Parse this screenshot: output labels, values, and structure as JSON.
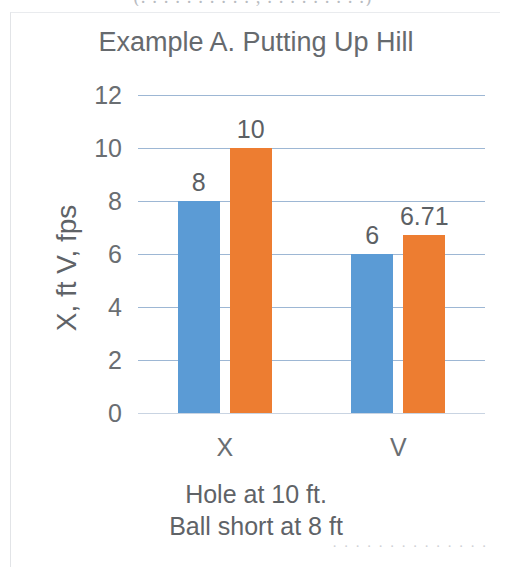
{
  "page": {
    "top_cut_text": "(. . . . . . .     . . . ,  . . . . . .     . . .)",
    "bottom_cut_text": ". . . . . .   . . . . .   . . ."
  },
  "chart_data": {
    "type": "bar",
    "title": "Example A. Putting Up Hill",
    "categories": [
      "X",
      "V"
    ],
    "series": [
      {
        "name": "X",
        "color": "#5B9BD5",
        "values": [
          8,
          6
        ],
        "labels": [
          "8",
          "6"
        ]
      },
      {
        "name": "V",
        "color": "#ED7D31",
        "values": [
          10,
          6.71
        ],
        "labels": [
          "10",
          "6.71"
        ]
      }
    ],
    "ylabel": "X, ft  V, fps",
    "xlabel": "",
    "ylim": [
      0,
      12
    ],
    "yticks": [
      12,
      10,
      8,
      6,
      4,
      2,
      0
    ],
    "ytick_labels": [
      "12",
      "10",
      "8",
      "6",
      "4",
      "2",
      "0"
    ],
    "grid": true,
    "gridline_color": "#9DB7D4",
    "legend": "none",
    "caption_lines": [
      "Hole at 10 ft.",
      "Ball short at 8 ft"
    ]
  }
}
